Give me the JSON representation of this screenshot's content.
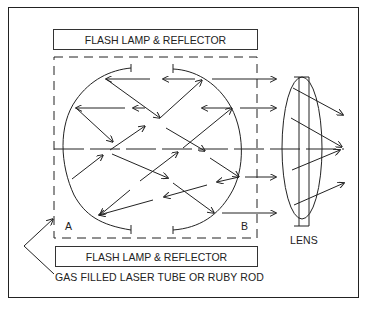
{
  "diagram": {
    "top_lamp_label": "FLASH LAMP & REFLECTOR",
    "bottom_lamp_label": "FLASH LAMP & REFLECTOR",
    "end_label_a": "A",
    "end_label_b": "B",
    "lens_label": "LENS",
    "tube_label": "GAS FILLED LASER TUBE OR RUBY ROD",
    "components": [
      "flash-lamp-top",
      "flash-lamp-bottom",
      "laser-tube-dashed",
      "mirror-arc-left",
      "mirror-arc-right",
      "lens",
      "optical-axis"
    ],
    "colors": {
      "line": "#222222",
      "background": "#ffffff"
    }
  }
}
